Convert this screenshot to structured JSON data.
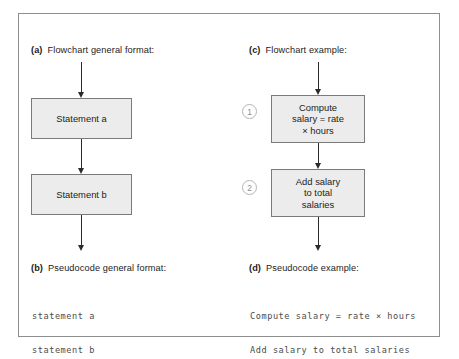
{
  "figure": {
    "background_color": "#ffffff",
    "frame_border_color": "#8e8e8e",
    "box_fill_color": "#ececec",
    "box_border_color": "#7a7a7a",
    "arrow_color": "#2b2b2b",
    "code_text_color": "#4c4c4c"
  },
  "sections": {
    "a": {
      "tag": "(a)",
      "title": "Flowchart general format:",
      "boxes": [
        {
          "lines": [
            "Statement a"
          ]
        },
        {
          "lines": [
            "Statement b"
          ]
        }
      ]
    },
    "b": {
      "tag": "(b)",
      "title": "Pseudocode general format:",
      "code_lines": [
        "statement a",
        "statement b"
      ]
    },
    "c": {
      "tag": "(c)",
      "title": "Flowchart example:",
      "boxes": [
        {
          "step": "1",
          "lines": [
            "Compute",
            "salary = rate",
            "× hours"
          ]
        },
        {
          "step": "2",
          "lines": [
            "Add salary",
            "to total",
            "salaries"
          ]
        }
      ]
    },
    "d": {
      "tag": "(d)",
      "title": "Pseudocode example:",
      "code_lines": [
        "Compute salary = rate × hours",
        "Add salary to total salaries"
      ]
    }
  }
}
